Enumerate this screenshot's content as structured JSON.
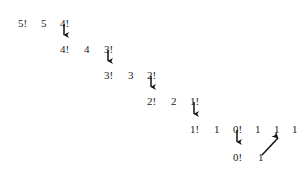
{
  "figure": {
    "background_color": "#ffffff",
    "text_color": "#1a1a1a",
    "arrow_color": "#111111",
    "width": 308,
    "height": 175
  },
  "rows": [
    {
      "id": "row-1",
      "y": 18,
      "tokens": [
        {
          "text": "5!",
          "x": 18
        },
        {
          "text": "5",
          "x": 41
        },
        {
          "text": "4!",
          "x": 60
        }
      ]
    },
    {
      "id": "row-2",
      "y": 44,
      "tokens": [
        {
          "text": "4!",
          "x": 60
        },
        {
          "text": "4",
          "x": 84
        },
        {
          "text": "3!",
          "x": 104
        }
      ]
    },
    {
      "id": "row-3",
      "y": 70,
      "tokens": [
        {
          "text": "3!",
          "x": 104
        },
        {
          "text": "3",
          "x": 128
        },
        {
          "text": "2!",
          "x": 147
        }
      ]
    },
    {
      "id": "row-4",
      "y": 96,
      "tokens": [
        {
          "text": "2!",
          "x": 147
        },
        {
          "text": "2",
          "x": 171
        },
        {
          "text": "1!",
          "x": 190
        }
      ]
    },
    {
      "id": "row-5",
      "y": 124,
      "tokens": [
        {
          "text": "1!",
          "x": 190
        },
        {
          "text": "1",
          "x": 214
        },
        {
          "text": "0!",
          "x": 233
        },
        {
          "text": "1",
          "x": 255
        },
        {
          "text": "1",
          "x": 274
        },
        {
          "text": "1",
          "x": 292
        }
      ]
    },
    {
      "id": "row-6",
      "y": 152,
      "tokens": [
        {
          "text": "0!",
          "x": 233
        },
        {
          "text": "1",
          "x": 258
        }
      ]
    }
  ],
  "arrows": {
    "down": [
      {
        "id": "arrow-5fact-to-4fact",
        "x": 64,
        "y1": 24,
        "y2": 40
      },
      {
        "id": "arrow-4fact-to-3fact",
        "x": 108,
        "y1": 50,
        "y2": 66
      },
      {
        "id": "arrow-3fact-to-2fact",
        "x": 151,
        "y1": 76,
        "y2": 92
      },
      {
        "id": "arrow-2fact-to-1fact",
        "x": 194,
        "y1": 102,
        "y2": 119
      },
      {
        "id": "arrow-1fact-to-0fact",
        "x": 237,
        "y1": 130,
        "y2": 147
      }
    ],
    "diagonal": [
      {
        "id": "arrow-return-value",
        "x1": 262,
        "y1": 155,
        "x2": 281,
        "y2": 135
      }
    ]
  }
}
